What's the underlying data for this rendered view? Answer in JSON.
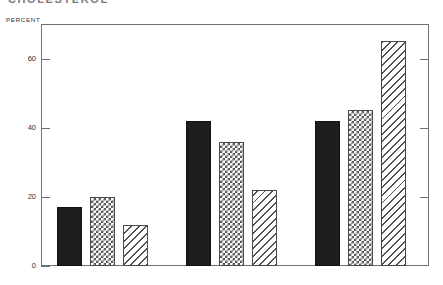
{
  "chart_title": "CHOLESTEROL",
  "axis": {
    "y_label": "PERCENT",
    "y_ticks": [
      "0",
      "20",
      "40",
      "60"
    ]
  },
  "categories": [
    {
      "label": "SATURATED"
    },
    {
      "label": "MONOUNSATURATED"
    },
    {
      "label": "POLYUNSATURATED"
    }
  ],
  "chart_data": {
    "type": "bar",
    "title": "CHOLESTEROL",
    "xlabel": "",
    "ylabel": "PERCENT",
    "ylim": [
      0,
      70
    ],
    "yticks": [
      0,
      20,
      40,
      60
    ],
    "grid": false,
    "legend": "none",
    "categories": [
      "SATURATED",
      "MONOUNSATURATED",
      "POLYUNSATURATED"
    ],
    "series": [
      {
        "name": "solid-black",
        "pattern": "solid",
        "values": [
          17,
          42,
          42
        ]
      },
      {
        "name": "checkerboard",
        "pattern": "checker",
        "values": [
          20,
          36,
          45
        ]
      },
      {
        "name": "diagonal-hatch",
        "pattern": "hatch",
        "values": [
          12,
          22,
          65
        ]
      }
    ]
  },
  "colors": {
    "axis": "#6d7074",
    "solid_bar": "#1d1d1d",
    "pattern_outline": "#4a4a4a",
    "background": "#ffffff"
  }
}
